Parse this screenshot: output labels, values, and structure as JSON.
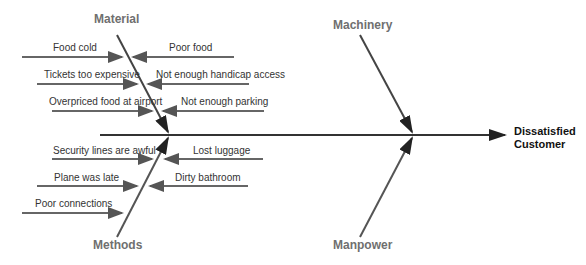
{
  "diagram": {
    "type": "fishbone",
    "effect": {
      "line1": "Dissatisfied",
      "line2": "Customer"
    },
    "colors": {
      "spine": "#333333",
      "bone": "#444444",
      "cause_arrow": "#666666",
      "category_text": "#6f6f6f"
    },
    "categories": [
      {
        "name": "Material",
        "causes": [
          "Food cold",
          "Poor food",
          "Tickets too expensive",
          "Not enough handicap access",
          "Overpriced food at airport",
          "Not enough parking"
        ]
      },
      {
        "name": "Machinery",
        "causes": []
      },
      {
        "name": "Methods",
        "causes": [
          "Security lines are awful",
          "Lost luggage",
          "Plane was late",
          "Dirty bathroom",
          "Poor connections"
        ]
      },
      {
        "name": "Manpower",
        "causes": []
      }
    ]
  }
}
